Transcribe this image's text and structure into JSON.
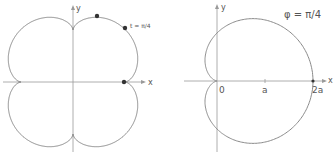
{
  "left_figure": {
    "x_axis_label": "x",
    "y_axis_label": "y",
    "annotation": "t = π/4",
    "curve_type": "four-lobed closed curve with cusps on axes",
    "marked_points": 3
  },
  "right_figure": {
    "x_axis_label": "x",
    "y_axis_label": "y",
    "annotation": "φ = π/4",
    "tick_labels": [
      "0",
      "a",
      "2a"
    ],
    "curve_type": "cardioid r = a(1 + cos φ)"
  },
  "colors": {
    "curve": "#8a8a8a",
    "axis": "#9a9a9a",
    "text": "#555555",
    "point": "#333333"
  }
}
